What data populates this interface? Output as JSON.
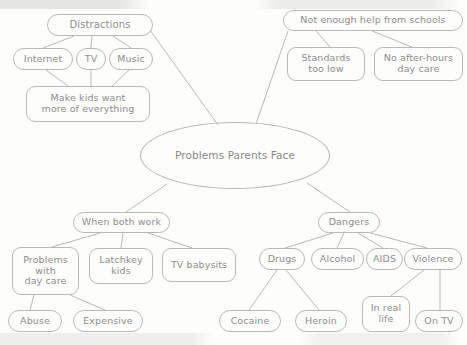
{
  "diagram": {
    "title": "Problems Parents Face",
    "type": "mind-map",
    "style": {
      "background": "#fdfdfc",
      "stroke": "#b9b9b7",
      "text": "#8e8e8c"
    },
    "center": {
      "label": "Problems Parents Face",
      "shape": "ellipse",
      "x": 140,
      "y": 122,
      "w": 190,
      "h": 67
    },
    "nodes": [
      {
        "id": "distractions",
        "label": "Distractions",
        "shape": "pill",
        "x": 47,
        "y": 14,
        "w": 106,
        "h": 22,
        "font": 10
      },
      {
        "id": "internet",
        "label": "Internet",
        "shape": "pill",
        "x": 13,
        "y": 48,
        "w": 60,
        "h": 22,
        "font": 9.5
      },
      {
        "id": "tv",
        "label": "TV",
        "shape": "pill",
        "x": 76,
        "y": 48,
        "w": 30,
        "h": 22,
        "font": 9.5
      },
      {
        "id": "music",
        "label": "Music",
        "shape": "pill",
        "x": 109,
        "y": 48,
        "w": 44,
        "h": 22,
        "font": 9.5
      },
      {
        "id": "makekids",
        "label": "Make kids want\nmore of everything",
        "shape": "round",
        "x": 26,
        "y": 86,
        "w": 124,
        "h": 36,
        "font": 9.5
      },
      {
        "id": "schools",
        "label": "Not enough help from schools",
        "shape": "pill",
        "x": 283,
        "y": 10,
        "w": 180,
        "h": 21,
        "font": 9.5
      },
      {
        "id": "standards",
        "label": "Standards\ntoo low",
        "shape": "round",
        "x": 287,
        "y": 47,
        "w": 78,
        "h": 34,
        "font": 9.5
      },
      {
        "id": "afterhours",
        "label": "No after-hours\nday care",
        "shape": "round",
        "x": 374,
        "y": 47,
        "w": 89,
        "h": 34,
        "font": 9.5
      },
      {
        "id": "bothwork",
        "label": "When both work",
        "shape": "pill",
        "x": 73,
        "y": 212,
        "w": 97,
        "h": 21,
        "font": 9.5
      },
      {
        "id": "daycare",
        "label": "Problems\nwith\nday care",
        "shape": "round",
        "x": 12,
        "y": 247,
        "w": 67,
        "h": 48,
        "font": 9.5
      },
      {
        "id": "latchkey",
        "label": "Latchkey\nkids",
        "shape": "round",
        "x": 89,
        "y": 248,
        "w": 64,
        "h": 36,
        "font": 9.5
      },
      {
        "id": "tvbabysits",
        "label": "TV babysits",
        "shape": "round",
        "x": 162,
        "y": 248,
        "w": 74,
        "h": 34,
        "font": 9.5
      },
      {
        "id": "abuse",
        "label": "Abuse",
        "shape": "pill",
        "x": 8,
        "y": 310,
        "w": 54,
        "h": 22,
        "font": 9.5
      },
      {
        "id": "expensive",
        "label": "Expensive",
        "shape": "pill",
        "x": 73,
        "y": 310,
        "w": 70,
        "h": 22,
        "font": 9.5
      },
      {
        "id": "dangers",
        "label": "Dangers",
        "shape": "pill",
        "x": 318,
        "y": 212,
        "w": 62,
        "h": 21,
        "font": 9.5
      },
      {
        "id": "drugs",
        "label": "Drugs",
        "shape": "pill",
        "x": 259,
        "y": 248,
        "w": 46,
        "h": 22,
        "font": 9.5
      },
      {
        "id": "alcohol",
        "label": "Alcohol",
        "shape": "pill",
        "x": 311,
        "y": 248,
        "w": 53,
        "h": 22,
        "font": 9.5
      },
      {
        "id": "aids",
        "label": "AIDS",
        "shape": "pill",
        "x": 366,
        "y": 248,
        "w": 37,
        "h": 22,
        "font": 9.5
      },
      {
        "id": "violence",
        "label": "Violence",
        "shape": "pill",
        "x": 404,
        "y": 248,
        "w": 58,
        "h": 22,
        "font": 9.5
      },
      {
        "id": "cocaine",
        "label": "Cocaine",
        "shape": "pill",
        "x": 219,
        "y": 310,
        "w": 62,
        "h": 22,
        "font": 9.5
      },
      {
        "id": "heroin",
        "label": "Heroin",
        "shape": "pill",
        "x": 295,
        "y": 310,
        "w": 52,
        "h": 22,
        "font": 9.5
      },
      {
        "id": "inreallife",
        "label": "In real\nlife",
        "shape": "round",
        "x": 362,
        "y": 296,
        "w": 48,
        "h": 36,
        "font": 9.5
      },
      {
        "id": "ontv",
        "label": "On TV",
        "shape": "pill",
        "x": 415,
        "y": 310,
        "w": 48,
        "h": 22,
        "font": 9.5
      }
    ],
    "edges": [
      {
        "from": "distractions",
        "to": "internet",
        "x1": 74,
        "y1": 36,
        "x2": 43,
        "y2": 48
      },
      {
        "from": "distractions",
        "to": "tv",
        "x1": 92,
        "y1": 36,
        "x2": 91,
        "y2": 48
      },
      {
        "from": "distractions",
        "to": "music",
        "x1": 113,
        "y1": 36,
        "x2": 131,
        "y2": 48
      },
      {
        "from": "internet",
        "to": "makekids",
        "x1": 46,
        "y1": 70,
        "x2": 68,
        "y2": 86
      },
      {
        "from": "tv",
        "to": "makekids",
        "x1": 91,
        "y1": 70,
        "x2": 91,
        "y2": 86
      },
      {
        "from": "music",
        "to": "makekids",
        "x1": 129,
        "y1": 70,
        "x2": 112,
        "y2": 86
      },
      {
        "from": "distractions",
        "to": "center",
        "x1": 150,
        "y1": 30,
        "x2": 218,
        "y2": 125
      },
      {
        "from": "schools",
        "to": "standards",
        "x1": 316,
        "y1": 31,
        "x2": 330,
        "y2": 47
      },
      {
        "from": "schools",
        "to": "afterhours",
        "x1": 372,
        "y1": 31,
        "x2": 412,
        "y2": 47
      },
      {
        "from": "schools",
        "to": "center",
        "x1": 288,
        "y1": 31,
        "x2": 256,
        "y2": 124
      },
      {
        "from": "center",
        "to": "bothwork",
        "x1": 167,
        "y1": 184,
        "x2": 126,
        "y2": 212
      },
      {
        "from": "center",
        "to": "dangers",
        "x1": 307,
        "y1": 183,
        "x2": 350,
        "y2": 212
      },
      {
        "from": "bothwork",
        "to": "daycare",
        "x1": 100,
        "y1": 233,
        "x2": 52,
        "y2": 247
      },
      {
        "from": "bothwork",
        "to": "latchkey",
        "x1": 123,
        "y1": 233,
        "x2": 121,
        "y2": 248
      },
      {
        "from": "bothwork",
        "to": "tvbabysits",
        "x1": 148,
        "y1": 233,
        "x2": 192,
        "y2": 248
      },
      {
        "from": "daycare",
        "to": "abuse",
        "x1": 34,
        "y1": 295,
        "x2": 30,
        "y2": 310
      },
      {
        "from": "daycare",
        "to": "expensive",
        "x1": 70,
        "y1": 295,
        "x2": 105,
        "y2": 310
      },
      {
        "from": "dangers",
        "to": "drugs",
        "x1": 333,
        "y1": 233,
        "x2": 285,
        "y2": 248
      },
      {
        "from": "dangers",
        "to": "alcohol",
        "x1": 344,
        "y1": 233,
        "x2": 337,
        "y2": 248
      },
      {
        "from": "dangers",
        "to": "aids",
        "x1": 358,
        "y1": 233,
        "x2": 383,
        "y2": 248
      },
      {
        "from": "dangers",
        "to": "violence",
        "x1": 370,
        "y1": 233,
        "x2": 427,
        "y2": 248
      },
      {
        "from": "drugs",
        "to": "cocaine",
        "x1": 277,
        "y1": 270,
        "x2": 249,
        "y2": 310
      },
      {
        "from": "drugs",
        "to": "heroin",
        "x1": 286,
        "y1": 270,
        "x2": 319,
        "y2": 310
      },
      {
        "from": "violence",
        "to": "inreallife",
        "x1": 424,
        "y1": 270,
        "x2": 391,
        "y2": 296
      },
      {
        "from": "violence",
        "to": "ontv",
        "x1": 440,
        "y1": 270,
        "x2": 440,
        "y2": 310
      }
    ]
  }
}
